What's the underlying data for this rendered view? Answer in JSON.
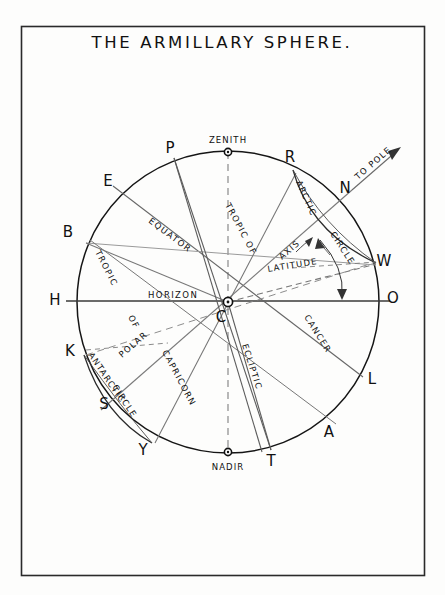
{
  "page": {
    "title": "THE ARMILLARY SPHERE.",
    "background_color": "#fdfdfc",
    "ink_color": "#111111",
    "faint_ink_color": "#5a5a5a",
    "border_color": "#2a2a2a"
  },
  "diagram": {
    "type": "armillary-sphere-celestial-diagram",
    "center_label": "C",
    "circle": {
      "center_x": 228,
      "center_y": 302,
      "radius": 151
    },
    "poles": {
      "zenith_label": "ZENITH",
      "nadir_label": "NADIR"
    },
    "point_labels": [
      {
        "id": "P",
        "text": "P",
        "x": 170,
        "y": 153
      },
      {
        "id": "R",
        "text": "R",
        "x": 290,
        "y": 162
      },
      {
        "id": "N",
        "text": "N",
        "x": 345,
        "y": 193
      },
      {
        "id": "W",
        "text": "W",
        "x": 382,
        "y": 262
      },
      {
        "id": "O",
        "text": "O",
        "x": 391,
        "y": 300
      },
      {
        "id": "L",
        "text": "L",
        "x": 370,
        "y": 381
      },
      {
        "id": "A",
        "text": "A",
        "x": 327,
        "y": 434
      },
      {
        "id": "T",
        "text": "T",
        "x": 271,
        "y": 462
      },
      {
        "id": "Y",
        "text": "Y",
        "x": 143,
        "y": 451
      },
      {
        "id": "S",
        "text": "S",
        "x": 104,
        "y": 406
      },
      {
        "id": "K",
        "text": "K",
        "x": 71,
        "y": 352
      },
      {
        "id": "H",
        "text": "H",
        "x": 57,
        "y": 300
      },
      {
        "id": "B",
        "text": "B",
        "x": 68,
        "y": 233
      },
      {
        "id": "E",
        "text": "E",
        "x": 108,
        "y": 182
      },
      {
        "id": "C",
        "text": "C",
        "x": 222,
        "y": 319
      }
    ],
    "curve_labels": [
      {
        "id": "equator",
        "text": "EQUATOR"
      },
      {
        "id": "horizon",
        "text": "HORIZON"
      },
      {
        "id": "axis",
        "text": "AXIS"
      },
      {
        "id": "latitude",
        "text": "LATITUDE"
      },
      {
        "id": "to-pole",
        "text": "TO POLE"
      },
      {
        "id": "arctic",
        "text": "ARCTIC"
      },
      {
        "id": "arctic-circle",
        "text": "CIRCLE"
      },
      {
        "id": "tropic-of-cancer-tropic",
        "text": "TROPIC OF"
      },
      {
        "id": "tropic-of-cancer-name",
        "text": "CANCER"
      },
      {
        "id": "tropic-of-capricorn-tropic",
        "text": "TROPIC"
      },
      {
        "id": "tropic-of-capricorn-of",
        "text": "OF"
      },
      {
        "id": "tropic-of-capricorn-name",
        "text": "CAPRICORN"
      },
      {
        "id": "ecliptic",
        "text": "ECLIPTIC"
      },
      {
        "id": "antarctic",
        "text": "ANTARCTIC"
      },
      {
        "id": "antarctic-polar",
        "text": "POLAR"
      },
      {
        "id": "antarctic-circle",
        "text": "CIRCLE"
      }
    ]
  }
}
